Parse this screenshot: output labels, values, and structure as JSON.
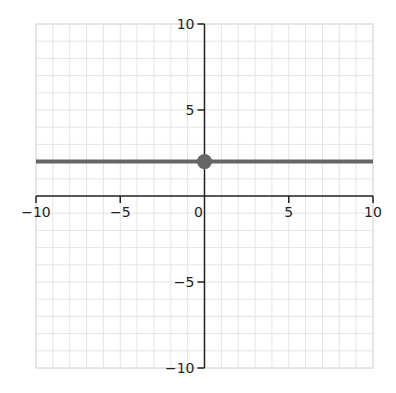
{
  "chart_data": {
    "type": "line",
    "title": "",
    "xlabel": "",
    "ylabel": "",
    "xlim": [
      -10,
      10
    ],
    "ylim": [
      -10,
      10
    ],
    "grid": true,
    "grid_minor_step": 1,
    "x_ticks": [
      -10,
      -5,
      0,
      5,
      10
    ],
    "x_tick_labels": [
      "−10",
      "−5",
      "0",
      "5",
      "10"
    ],
    "y_ticks": [
      -10,
      -5,
      5,
      10
    ],
    "y_tick_labels": [
      "−10",
      "−5",
      "5",
      "10"
    ],
    "series": [
      {
        "name": "y = 2",
        "kind": "horizontal-line",
        "x": [
          -10,
          10
        ],
        "y": [
          2,
          2
        ],
        "color": "#666666"
      }
    ],
    "points": [
      {
        "x": 0,
        "y": 2,
        "color": "#666666",
        "label": "y-intercept"
      }
    ],
    "legend": null
  },
  "colors": {
    "axis": "#222222",
    "grid": "#e4e4e4",
    "border": "#d0d0d0",
    "line": "#666666"
  }
}
